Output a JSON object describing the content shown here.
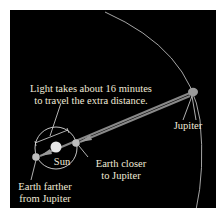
{
  "diagram": {
    "caption_light": [
      "Light takes about 16 minutes",
      "to travel the extra distance."
    ],
    "sun_label": "Sun",
    "jupiter_label": "Jupiter",
    "earth_closer_label": [
      "Earth closer",
      "to Jupiter"
    ],
    "earth_farther_label": [
      "Earth farther",
      "from Jupiter"
    ],
    "colors": {
      "background": "#000000",
      "frame": "#ffffff",
      "text": "#f0ead8",
      "orbit": "#d8d8d8",
      "arrow": "#8a8a8a"
    }
  }
}
